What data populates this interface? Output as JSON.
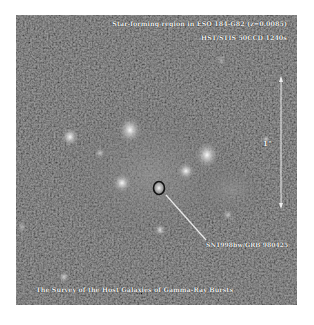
{
  "image": {
    "title_line1": "Star-forming region in ESO 184-G82 (z=0.0085)",
    "title_line2": "HST/STIS 50CCD 1240s",
    "caption": "The Survey of the Host Galaxies of Gamma-Ray Bursts",
    "marker_label": "SN1998bw/GRB 980425",
    "scale_label": "1\"",
    "colors": {
      "background": "#2a2a2a",
      "annotation": "#f2f2f2",
      "marker_outline": "#111111"
    }
  }
}
